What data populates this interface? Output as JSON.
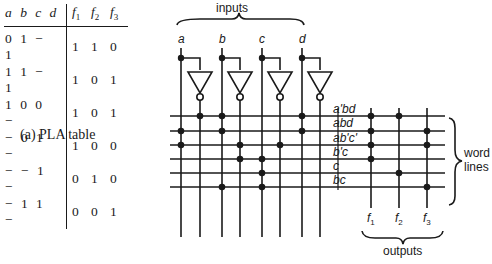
{
  "table": {
    "header_inputs": "a b c d",
    "header_outputs": [
      "f1",
      "f2",
      "f3"
    ],
    "rows": [
      {
        "inputs": "0 1 − 1",
        "outputs": [
          "1",
          "1",
          "0"
        ]
      },
      {
        "inputs": "1 1 − 1",
        "outputs": [
          "1",
          "0",
          "1"
        ]
      },
      {
        "inputs": "1 0 0 −",
        "outputs": [
          "1",
          "0",
          "1"
        ]
      },
      {
        "inputs": "− 0 1 −",
        "outputs": [
          "1",
          "0",
          "0"
        ]
      },
      {
        "inputs": "− − 1 −",
        "outputs": [
          "0",
          "1",
          "0"
        ]
      },
      {
        "inputs": "− 1 1 −",
        "outputs": [
          "0",
          "0",
          "1"
        ]
      }
    ],
    "caption": "(a)  PLA table"
  },
  "diagram": {
    "inputs_label": "inputs",
    "input_names": [
      "a",
      "b",
      "c",
      "d"
    ],
    "product_terms": [
      "a'bd",
      "abd",
      "ab'c'",
      "b'c",
      "c",
      "bc"
    ],
    "word_lines_label": [
      "word",
      "lines"
    ],
    "output_names": [
      "f1",
      "f2",
      "f3"
    ],
    "outputs_label": "outputs",
    "and_plane": [
      [
        "a'",
        "b",
        "d"
      ],
      [
        "a",
        "b",
        "d"
      ],
      [
        "a",
        "b'",
        "c'"
      ],
      [
        "b'",
        "c"
      ],
      [
        "c"
      ],
      [
        "b",
        "c"
      ]
    ],
    "or_plane": {
      "f1": [
        "a'bd",
        "abd",
        "ab'c'",
        "b'c"
      ],
      "f2": [
        "a'bd",
        "c"
      ],
      "f3": [
        "abd",
        "ab'c'",
        "bc"
      ]
    }
  }
}
